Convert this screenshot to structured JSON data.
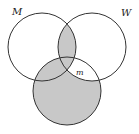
{
  "diagram": {
    "type": "venn",
    "sets": [
      {
        "id": "M",
        "label": "M",
        "cx": 42,
        "cy": 47,
        "r": 34
      },
      {
        "id": "W",
        "label": "W",
        "cx": 92,
        "cy": 47,
        "r": 34
      },
      {
        "id": "C",
        "label": "",
        "cx": 67,
        "cy": 91,
        "r": 34
      }
    ],
    "region_label": "m",
    "shaded_regions": [
      "M∩W",
      "C minus (W minus M)"
    ],
    "colors": {
      "shade": "#c8c8c8",
      "stroke": "#333333",
      "background": "#ffffff"
    }
  }
}
